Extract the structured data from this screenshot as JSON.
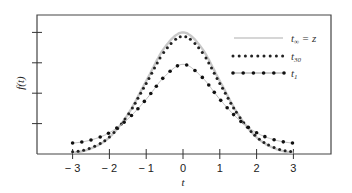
{
  "chart_data": {
    "type": "line",
    "title": "",
    "xlabel": "t",
    "ylabel": "f(t)",
    "xlim": [
      -3,
      3
    ],
    "ylim": [
      0,
      4.3
    ],
    "x_ticks": [
      "-3",
      "-2",
      "-1",
      "0",
      "1",
      "2",
      "3"
    ],
    "y_ticks": [
      1,
      2,
      3,
      4
    ],
    "y_tick_labels": [
      "",
      "",
      "",
      ""
    ],
    "grid": false,
    "legend_position": "upper right",
    "x": [
      -3,
      -2.5,
      -2,
      -1.5,
      -1,
      -0.5,
      0,
      0.5,
      1,
      1.5,
      2,
      2.5,
      3
    ],
    "series": [
      {
        "name": "t∞ = z",
        "style": "solid-gray",
        "values": [
          0.04,
          0.18,
          0.55,
          1.3,
          2.4,
          3.5,
          4.0,
          3.5,
          2.4,
          1.3,
          0.55,
          0.18,
          0.04
        ]
      },
      {
        "name": "t30",
        "style": "dotted",
        "values": [
          0.07,
          0.2,
          0.56,
          1.28,
          2.32,
          3.38,
          3.87,
          3.38,
          2.32,
          1.28,
          0.56,
          0.2,
          0.07
        ]
      },
      {
        "name": "t1",
        "style": "dot-dash",
        "values": [
          0.36,
          0.46,
          0.7,
          1.15,
          1.8,
          2.55,
          2.95,
          2.55,
          1.8,
          1.15,
          0.7,
          0.46,
          0.36
        ]
      }
    ]
  },
  "legend": [
    {
      "main": "t",
      "sub": "∞",
      "suffix": " = z"
    },
    {
      "main": "t",
      "sub": "30",
      "suffix": ""
    },
    {
      "main": "t",
      "sub": "1",
      "suffix": ""
    }
  ],
  "axes": {
    "xlabel_main": "t",
    "ylabel": "f(t)"
  }
}
